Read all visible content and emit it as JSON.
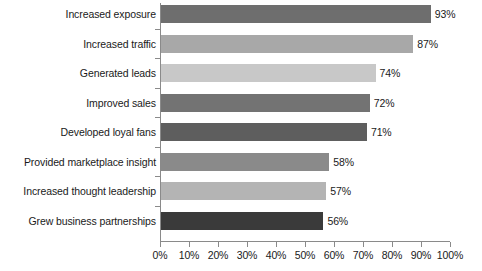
{
  "chart_data": {
    "type": "bar",
    "orientation": "horizontal",
    "title": "",
    "subtitle": "",
    "xlabel": "",
    "ylabel": "",
    "xlim": [
      0,
      100
    ],
    "grid": false,
    "legend": null,
    "value_suffix": "%",
    "categories": [
      "Increased exposure",
      "Increased traffic",
      "Generated leads",
      "Improved sales",
      "Developed loyal fans",
      "Provided marketplace insight",
      "Increased thought leadership",
      "Grew business partnerships"
    ],
    "values": [
      93,
      87,
      74,
      72,
      71,
      58,
      57,
      56
    ],
    "value_labels": [
      "93%",
      "87%",
      "74%",
      "72%",
      "71%",
      "58%",
      "57%",
      "56%"
    ],
    "bar_colors": [
      "#6e6e6e",
      "#a8a8a8",
      "#c8c8c8",
      "#737373",
      "#5e5e5e",
      "#8a8a8a",
      "#b4b4b4",
      "#3a3a3a"
    ],
    "xticks": [
      0,
      10,
      20,
      30,
      40,
      50,
      60,
      70,
      80,
      90,
      100
    ],
    "xtick_labels": [
      "0%",
      "10%",
      "20%",
      "30%",
      "40%",
      "50%",
      "60%",
      "70%",
      "80%",
      "90%",
      "100%"
    ],
    "axis_color": "#8a8a8a",
    "text_color": "#1a1a1a",
    "background": "#ffffff"
  }
}
